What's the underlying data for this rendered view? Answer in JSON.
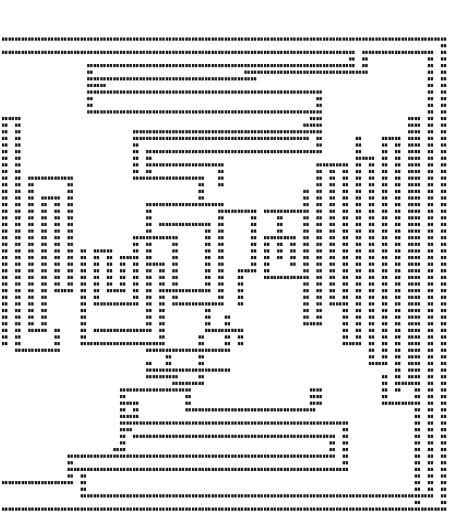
{
  "artwork": {
    "kind": "ascii-maze",
    "glyph": "#",
    "ink_color": "#1a1a1a",
    "background": "#ffffff",
    "cell_w": 6.55,
    "cell_h": 6.62,
    "origin_x": 2,
    "origin_y": 39,
    "walls": [
      [
        [
          0,
          0
        ],
        [
          67,
          0
        ],
        [
          67,
          71
        ],
        [
          0,
          71
        ]
      ],
      [
        [
          0,
          2
        ],
        [
          53,
          2
        ],
        [
          53,
          4
        ],
        [
          37,
          4
        ]
      ],
      [
        [
          55,
          2
        ],
        [
          65,
          2
        ],
        [
          65,
          69
        ],
        [
          31,
          69
        ]
      ],
      [
        [
          55,
          2
        ],
        [
          55,
          5
        ],
        [
          38,
          5
        ]
      ],
      [
        [
          37,
          4
        ],
        [
          37,
          5
        ]
      ],
      [
        [
          38,
          5
        ],
        [
          38,
          6
        ],
        [
          13,
          6
        ]
      ],
      [
        [
          37,
          4
        ],
        [
          13,
          4
        ],
        [
          13,
          11
        ],
        [
          47,
          11
        ],
        [
          47,
          14
        ],
        [
          20,
          14
        ],
        [
          20,
          21
        ],
        [
          30,
          21
        ],
        [
          30,
          24
        ]
      ],
      [
        [
          13,
          6
        ],
        [
          14,
          6
        ],
        [
          14,
          7
        ]
      ],
      [
        [
          15,
          7
        ],
        [
          15,
          8
        ],
        [
          48,
          8
        ],
        [
          48,
          17
        ],
        [
          22,
          17
        ],
        [
          22,
          19
        ]
      ],
      [
        [
          15,
          8
        ],
        [
          13,
          8
        ]
      ],
      [
        [
          21,
          14
        ],
        [
          21,
          15
        ],
        [
          46,
          15
        ],
        [
          46,
          13
        ]
      ],
      [
        [
          22,
          19
        ],
        [
          33,
          19
        ],
        [
          33,
          22
        ]
      ],
      [
        [
          22,
          21
        ],
        [
          22,
          19
        ]
      ],
      [
        [
          0,
          12
        ],
        [
          2,
          12
        ],
        [
          2,
          46
        ]
      ],
      [
        [
          0,
          12
        ],
        [
          0,
          46
        ]
      ],
      [
        [
          4,
          21
        ],
        [
          10,
          21
        ],
        [
          10,
          38
        ],
        [
          8,
          38
        ],
        [
          8,
          24
        ],
        [
          6,
          24
        ],
        [
          6,
          44
        ],
        [
          4,
          44
        ],
        [
          4,
          21
        ]
      ],
      [
        [
          2,
          46
        ],
        [
          2,
          47
        ],
        [
          8,
          47
        ],
        [
          8,
          44
        ]
      ],
      [
        [
          14,
          32
        ],
        [
          14,
          40
        ],
        [
          20,
          40
        ],
        [
          20,
          33
        ],
        [
          18,
          33
        ],
        [
          18,
          38
        ],
        [
          16,
          38
        ],
        [
          16,
          32
        ],
        [
          14,
          32
        ]
      ],
      [
        [
          12,
          32
        ],
        [
          12,
          46
        ],
        [
          24,
          46
        ],
        [
          24,
          34
        ],
        [
          22,
          34
        ],
        [
          22,
          44
        ],
        [
          14,
          44
        ]
      ],
      [
        [
          20,
          33
        ],
        [
          20,
          30
        ],
        [
          26,
          30
        ],
        [
          26,
          37
        ]
      ],
      [
        [
          26,
          39
        ],
        [
          26,
          40
        ],
        [
          33,
          40
        ],
        [
          33,
          25
        ],
        [
          22,
          25
        ],
        [
          22,
          41
        ]
      ],
      [
        [
          24,
          28
        ],
        [
          31,
          28
        ],
        [
          31,
          38
        ],
        [
          24,
          38
        ]
      ],
      [
        [
          34,
          26
        ],
        [
          38,
          26
        ],
        [
          38,
          35
        ],
        [
          36,
          35
        ],
        [
          36,
          40
        ]
      ],
      [
        [
          40,
          26
        ],
        [
          46,
          26
        ],
        [
          46,
          36
        ],
        [
          40,
          36
        ],
        [
          40,
          30
        ],
        [
          44,
          30
        ],
        [
          44,
          34
        ]
      ],
      [
        [
          42,
          26
        ],
        [
          42,
          33
        ]
      ],
      [
        [
          46,
          23
        ],
        [
          46,
          43
        ],
        [
          48,
          43
        ],
        [
          48,
          19
        ],
        [
          52,
          19
        ],
        [
          52,
          46
        ],
        [
          54,
          46
        ],
        [
          54,
          18
        ],
        [
          56,
          18
        ],
        [
          56,
          49
        ],
        [
          58,
          49
        ],
        [
          58,
          15
        ],
        [
          60,
          15
        ],
        [
          60,
          52
        ],
        [
          62,
          52
        ],
        [
          62,
          12
        ],
        [
          63,
          12
        ],
        [
          63,
          70
        ]
      ],
      [
        [
          54,
          18
        ],
        [
          54,
          15
        ]
      ],
      [
        [
          50,
          19
        ],
        [
          50,
          40
        ],
        [
          52,
          40
        ]
      ],
      [
        [
          34,
          42
        ],
        [
          34,
          47
        ],
        [
          22,
          47
        ]
      ],
      [
        [
          31,
          40
        ],
        [
          31,
          44
        ],
        [
          36,
          44
        ],
        [
          36,
          46
        ]
      ],
      [
        [
          25,
          48
        ],
        [
          25,
          51
        ],
        [
          22,
          51
        ],
        [
          22,
          49
        ]
      ],
      [
        [
          24,
          51
        ],
        [
          26,
          51
        ],
        [
          26,
          52
        ],
        [
          30,
          52
        ],
        [
          30,
          45
        ]
      ],
      [
        [
          34,
          50
        ],
        [
          23,
          50
        ]
      ],
      [
        [
          47,
          53
        ],
        [
          47,
          56
        ],
        [
          28,
          56
        ],
        [
          28,
          53
        ],
        [
          18,
          53
        ],
        [
          18,
          62
        ],
        [
          17,
          62
        ]
      ],
      [
        [
          18,
          55
        ],
        [
          20,
          55
        ],
        [
          20,
          58
        ],
        [
          52,
          58
        ],
        [
          52,
          62
        ]
      ],
      [
        [
          47,
          53
        ],
        [
          48,
          53
        ],
        [
          48,
          55
        ]
      ],
      [
        [
          19,
          57
        ],
        [
          19,
          59
        ]
      ],
      [
        [
          20,
          60
        ],
        [
          50,
          60
        ],
        [
          50,
          63
        ],
        [
          10,
          63
        ],
        [
          10,
          67
        ],
        [
          0,
          67
        ]
      ],
      [
        [
          10,
          65
        ],
        [
          12,
          65
        ],
        [
          12,
          69
        ],
        [
          65,
          69
        ]
      ],
      [
        [
          10,
          63
        ],
        [
          10,
          65
        ]
      ],
      [
        [
          12,
          65
        ],
        [
          52,
          65
        ],
        [
          52,
          63
        ]
      ],
      [
        [
          58,
          51
        ],
        [
          58,
          55
        ],
        [
          62,
          55
        ]
      ],
      [
        [
          60,
          49
        ],
        [
          60,
          53
        ]
      ]
    ]
  }
}
